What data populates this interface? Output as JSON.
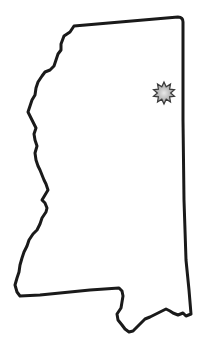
{
  "map": {
    "subject": "Mississippi state outline",
    "outline_color": "#1a1a1a",
    "fill_color": "#ffffff",
    "marker": {
      "type": "starburst",
      "label": "location marker",
      "cx": 164,
      "cy": 93,
      "outline_color": "#3a3a3a",
      "fill_color": "#b8b8b8"
    }
  }
}
